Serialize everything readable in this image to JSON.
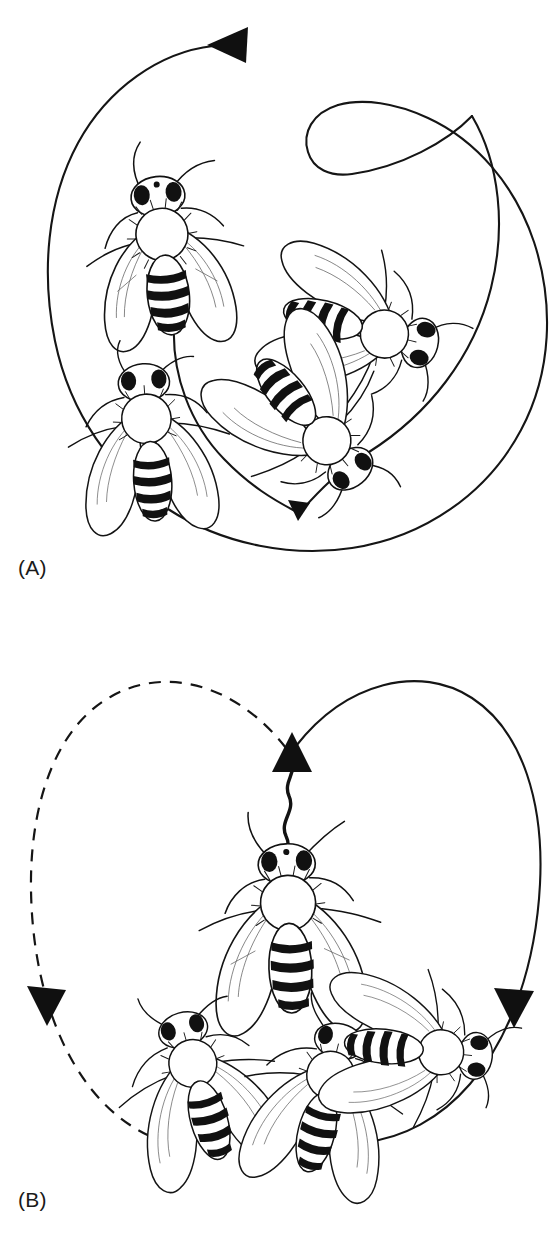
{
  "figure": {
    "type": "scientific-illustration",
    "background_color": "#ffffff",
    "ink_color": "#111111",
    "width": 559,
    "height": 1256
  },
  "panels": [
    {
      "id": "A",
      "label": "(A)",
      "dance_name": "round dance",
      "bee_count": 4,
      "path": {
        "style": "solid",
        "shape": "closed loop crossing itself at upper right",
        "arrowheads": [
          {
            "name": "top-arrowhead",
            "direction": "left",
            "x": 232,
            "y": 45,
            "size": "large"
          },
          {
            "name": "inner-arrowhead",
            "direction": "down",
            "x": 297,
            "y": 516,
            "size": "small"
          }
        ]
      }
    },
    {
      "id": "B",
      "label": "(B)",
      "dance_name": "waggle dance",
      "bee_count": 4,
      "path": {
        "style": "figure-eight: left loop dashed, right loop solid",
        "waggle_run": {
          "style": "zigzag vertical line",
          "direction": "up"
        },
        "arrowheads": [
          {
            "name": "center-arrowhead",
            "direction": "up",
            "x": 293,
            "y": 740,
            "size": "large"
          },
          {
            "name": "left-arrowhead",
            "direction": "down",
            "x": 48,
            "y": 1005,
            "size": "large"
          },
          {
            "name": "right-arrowhead",
            "direction": "down",
            "x": 513,
            "y": 1008,
            "size": "large"
          }
        ]
      }
    }
  ],
  "labels": {
    "panel_a": "(A)",
    "panel_b": "(B)"
  }
}
